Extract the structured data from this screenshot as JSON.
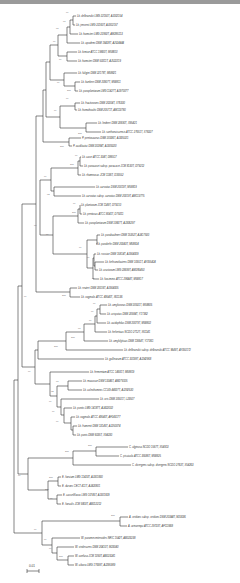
{
  "figure": {
    "scale_bar": "0.01"
  },
  "leaves": [
    {
      "label": "Lb. delbrueckii LMG 22150T, AJ002154",
      "x": 76,
      "y": 16
    },
    {
      "label": "Lb. jensenii LMG 22160T, AJ002157",
      "x": 75,
      "y": 25
    },
    {
      "label": "Lb. hamsteri LMG 22950T, AM285113",
      "x": 78,
      "y": 34
    },
    {
      "label": "Lb. apodemi DSM 16428T, AJ524444",
      "x": 80,
      "y": 43
    },
    {
      "label": "Lb. kimiae ATCC 19800T, M58810",
      "x": 77,
      "y": 52
    },
    {
      "label": "Lb. hamsteri DSM 50311T, AJ522219",
      "x": 77,
      "y": 61
    },
    {
      "label": "Lb. fuligini DSM 22178T, M58821",
      "x": 77,
      "y": 73
    },
    {
      "label": "Lb. kunkeei DSM 20907T, M58811",
      "x": 80,
      "y": 82
    },
    {
      "label": "Lb. paraplantarum LMG 11427T, AJ970077",
      "x": 78,
      "y": 91
    },
    {
      "label": "Lb. fructivorans DSM 20204T, X76330",
      "x": 80,
      "y": 103
    },
    {
      "label": "Lb. homohiochii DSM 20571T, AM113780",
      "x": 77,
      "y": 110
    },
    {
      "label": "Lb. lindneri DSM 20690T, X95421",
      "x": 97,
      "y": 123
    },
    {
      "label": "Lb. sanfranciscensis ATCC 27651T, X76327",
      "x": 101,
      "y": 132
    },
    {
      "label": "P. pentosaceus DSM 20336T, AJ305321",
      "x": 81,
      "y": 138
    },
    {
      "label": "P. acidilactici DSM 20284T, AJ305320",
      "x": 72,
      "y": 146
    },
    {
      "label": "Lb. casei ATCC 334T, D86517",
      "x": 81,
      "y": 157
    },
    {
      "label": "Lb. paracasei subsp. paracasei JCM 8130T, D79212",
      "x": 83,
      "y": 166
    },
    {
      "label": "Lb. rhamnosus JCM 1136T, D16552",
      "x": 81,
      "y": 175
    },
    {
      "label": "Lb. curvatus DSM 20019T, M58819",
      "x": 95,
      "y": 187
    },
    {
      "label": "Lb. curvatus subsp. curvatus DSM 20019T, AM113775",
      "x": 81,
      "y": 196
    },
    {
      "label": "Lb. plantarum JCM 1149T, D79210",
      "x": 80,
      "y": 205
    },
    {
      "label": "Lb. pentosus ATCC 8041T, D79211",
      "x": 82,
      "y": 214
    },
    {
      "label": "Lb. paraplantarum DSM 10667T, AJ306297",
      "x": 84,
      "y": 223
    },
    {
      "label": "Lb. parabuchneri DSM 15352T, AJ417500",
      "x": 100,
      "y": 235
    },
    {
      "label": "Lb. parakefiri DSM 20043T, M58824",
      "x": 96,
      "y": 244
    },
    {
      "label": "Lb. rossiae DSM 15814T, AJ564009",
      "x": 96,
      "y": 254
    },
    {
      "label": "Lb. kefiranofaciens DSM 10551T, AY055424",
      "x": 104,
      "y": 262
    },
    {
      "label": "Lb. crustorum LMG 23699T, AM285450",
      "x": 98,
      "y": 270
    },
    {
      "label": "Lb. farciminis ATCC 29644T, M58817",
      "x": 99,
      "y": 279
    },
    {
      "label": "Lb. reuteri DSM 20016T, AJ564005",
      "x": 77,
      "y": 288
    },
    {
      "label": "Lb. vaginalis ATCC 49540T, X61136",
      "x": 80,
      "y": 297
    },
    {
      "label": "Lb. amylovorus DSM 20531T, M58805",
      "x": 107,
      "y": 305
    },
    {
      "label": "Lb. crispatus DSM 20584T, Y17362",
      "x": 106,
      "y": 314
    },
    {
      "label": "Lb. acidophilus DSM 20079T, M58802",
      "x": 106,
      "y": 323
    },
    {
      "label": "Lb. helveticus NCDO 2712T, X61141",
      "x": 107,
      "y": 332
    },
    {
      "label": "Lb. amylolyticus DSM 11664T, Y17361",
      "x": 108,
      "y": 341
    },
    {
      "label": "Lb. delbrueckii subsp. delbrueckii ATCC 9649T, AY050172",
      "x": 123,
      "y": 350
    },
    {
      "label": "Lb. gallinarum ATCC 33199T, AJ242968",
      "x": 104,
      "y": 359
    },
    {
      "label": "Lb. fermentum ATCC 14931T, M58819",
      "x": 89,
      "y": 372
    },
    {
      "label": "Lb. mucosae DSM 13345T, AM279105",
      "x": 82,
      "y": 381
    },
    {
      "label": "Lb. coleohominis CCUG 44007T, AJ292530",
      "x": 82,
      "y": 390
    },
    {
      "label": "Lb. oris DSM 20501T, L23507",
      "x": 99,
      "y": 399
    },
    {
      "label": "Lb. pontis LMG 14187T, AJ422032",
      "x": 72,
      "y": 408
    },
    {
      "label": "Lb. vaginalis ATCC 49540T, AF243177",
      "x": 75,
      "y": 417
    },
    {
      "label": "Lb. frumenti DSM 13145T, AJ250074",
      "x": 77,
      "y": 426
    },
    {
      "label": "Lb. panis DSM 6035T, X94230",
      "x": 76,
      "y": 435
    },
    {
      "label": "C. alginosa NCDO 1567T, X54913",
      "x": 128,
      "y": 447
    },
    {
      "label": "C. piscicola ATCC 35586T, M58825",
      "x": 119,
      "y": 456
    },
    {
      "label": "C. divergens subsp. divergens NCDO 2763T, X54263",
      "x": 131,
      "y": 465
    },
    {
      "label": "E. faecium LMG 11423T, AJ301830",
      "x": 61,
      "y": 477
    },
    {
      "label": "E. durans CECT 411T, AJ420801",
      "x": 61,
      "y": 486
    },
    {
      "label": "E. casseliflavus LMG 10745T, AJ301829",
      "x": 62,
      "y": 495
    },
    {
      "label": "E. faecalis JCM 5803T, AB012212",
      "x": 61,
      "y": 504
    },
    {
      "label": "A. viridans subsp. viridans DSM 20344T, M23036",
      "x": 128,
      "y": 517
    },
    {
      "label": "A. urinaeequi ATCC 29723T, AF111668",
      "x": 127,
      "y": 526
    },
    {
      "label": "W. paramesenteroides NRIC 1542T, AB023238",
      "x": 80,
      "y": 538
    },
    {
      "label": "W. viridescens DSM 20410T, M23040",
      "x": 74,
      "y": 547
    },
    {
      "label": "W. confusa JCM 1093T, AB023241",
      "x": 74,
      "y": 556
    },
    {
      "label": "W. cibaria LMG 17699T, AJ295989",
      "x": 74,
      "y": 565
    }
  ],
  "bootstrap_values": [
    {
      "v": "99",
      "x": 70,
      "y": 14
    },
    {
      "v": "97",
      "x": 67,
      "y": 23
    },
    {
      "v": "98",
      "x": 60,
      "y": 30
    },
    {
      "v": "99",
      "x": 57,
      "y": 43
    },
    {
      "v": "99",
      "x": 63,
      "y": 61
    },
    {
      "v": "99",
      "x": 61,
      "y": 84
    },
    {
      "v": "100",
      "x": 71,
      "y": 92
    },
    {
      "v": "99",
      "x": 70,
      "y": 100
    },
    {
      "v": "99",
      "x": 58,
      "y": 112
    },
    {
      "v": "100",
      "x": 82,
      "y": 135
    },
    {
      "v": "100",
      "x": 64,
      "y": 148
    },
    {
      "v": "99",
      "x": 79,
      "y": 157
    },
    {
      "v": "100",
      "x": 74,
      "y": 166
    },
    {
      "v": "99",
      "x": 48,
      "y": 178
    },
    {
      "v": "93",
      "x": 51,
      "y": 196
    },
    {
      "v": "99",
      "x": 77,
      "y": 205
    },
    {
      "v": "100",
      "x": 76,
      "y": 214
    },
    {
      "v": "99",
      "x": 38,
      "y": 227
    },
    {
      "v": "99",
      "x": 50,
      "y": 236
    },
    {
      "v": "99",
      "x": 83,
      "y": 249
    },
    {
      "v": "99",
      "x": 91,
      "y": 259
    },
    {
      "v": "99",
      "x": 96,
      "y": 280
    },
    {
      "v": "100",
      "x": 66,
      "y": 297
    },
    {
      "v": "99",
      "x": 28,
      "y": 298
    },
    {
      "v": "99",
      "x": 97,
      "y": 305
    },
    {
      "v": "99",
      "x": 95,
      "y": 313
    },
    {
      "v": "99",
      "x": 93,
      "y": 322
    },
    {
      "v": "97",
      "x": 82,
      "y": 330
    },
    {
      "v": "100",
      "x": 75,
      "y": 339
    },
    {
      "v": "100",
      "x": 58,
      "y": 348
    },
    {
      "v": "99",
      "x": 32,
      "y": 373
    },
    {
      "v": "97",
      "x": 60,
      "y": 383
    },
    {
      "v": "92",
      "x": 55,
      "y": 393
    },
    {
      "v": "99",
      "x": 53,
      "y": 403
    },
    {
      "v": "99",
      "x": 56,
      "y": 413
    },
    {
      "v": "99",
      "x": 60,
      "y": 423
    },
    {
      "v": "100",
      "x": 92,
      "y": 447
    },
    {
      "v": "100",
      "x": 69,
      "y": 453
    },
    {
      "v": "99",
      "x": 22,
      "y": 477
    },
    {
      "v": "100",
      "x": 53,
      "y": 479
    },
    {
      "v": "100",
      "x": 49,
      "y": 491
    },
    {
      "v": "99",
      "x": 54,
      "y": 500
    },
    {
      "v": "100",
      "x": 115,
      "y": 517
    },
    {
      "v": "99",
      "x": 38,
      "y": 531
    },
    {
      "v": "99",
      "x": 48,
      "y": 541
    },
    {
      "v": "99",
      "x": 53,
      "y": 550
    },
    {
      "v": "100",
      "x": 63,
      "y": 558
    }
  ],
  "icons": {
    "scale_bar": "scale-bar"
  }
}
